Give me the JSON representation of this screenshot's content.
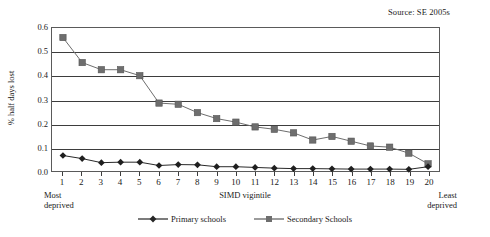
{
  "source_note": "Source: SE 2005s",
  "axis": {
    "y_title": "% half days lost",
    "x_title": "SIMD vigintile",
    "left_end_line1": "Most",
    "left_end_line2": "deprived",
    "right_end_line1": "Least",
    "right_end_line2": "deprived"
  },
  "legend": {
    "primary_label": "Primary schools",
    "secondary_label": "Secondary Schools"
  },
  "colors": {
    "primary_series": "#262626",
    "secondary_series": "#808080",
    "gridline": "#3d3d3d",
    "frame": "#5a5a5a",
    "text": "#1a1a1a",
    "background": "#ffffff"
  },
  "chart_data": {
    "type": "line",
    "title": "",
    "subtitle": "",
    "xlabel": "SIMD vigintile",
    "ylabel": "% half days lost",
    "xlim": [
      1,
      20
    ],
    "ylim": [
      0.0,
      0.6
    ],
    "ytick_labels": [
      "0.6",
      "0.5",
      "0.4",
      "0.3",
      "0.2",
      "0.1",
      "0.0"
    ],
    "ytick_values": [
      0.6,
      0.5,
      0.4,
      0.3,
      0.2,
      0.1,
      0.0
    ],
    "grid": true,
    "legend_position": "bottom-center",
    "annotations": [
      "Source: SE 2005s",
      "Most deprived",
      "Least deprived"
    ],
    "categories": [
      1,
      2,
      3,
      4,
      5,
      6,
      7,
      8,
      9,
      10,
      11,
      12,
      13,
      14,
      15,
      16,
      17,
      18,
      19,
      20
    ],
    "x": [
      1,
      2,
      3,
      4,
      5,
      6,
      7,
      8,
      9,
      10,
      11,
      12,
      13,
      14,
      15,
      16,
      17,
      18,
      19,
      20
    ],
    "series": [
      {
        "name": "Primary schools",
        "marker": "diamond",
        "color": "#262626",
        "values": [
          0.065,
          0.052,
          0.035,
          0.037,
          0.037,
          0.023,
          0.027,
          0.026,
          0.018,
          0.018,
          0.015,
          0.012,
          0.01,
          0.01,
          0.009,
          0.008,
          0.008,
          0.008,
          0.007,
          0.018
        ]
      },
      {
        "name": "Secondary Schools",
        "marker": "square",
        "color": "#808080",
        "values": [
          0.56,
          0.455,
          0.425,
          0.425,
          0.4,
          0.285,
          0.28,
          0.245,
          0.22,
          0.205,
          0.185,
          0.175,
          0.16,
          0.13,
          0.145,
          0.125,
          0.105,
          0.1,
          0.075,
          0.03
        ]
      }
    ]
  }
}
